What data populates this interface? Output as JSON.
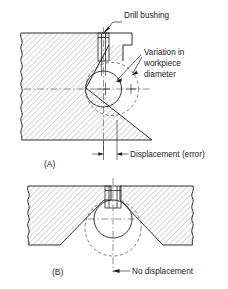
{
  "figure": {
    "title_absent": true,
    "background_color": "#ffffff",
    "line_color": "#1a1a1a",
    "hatch_color": "#9a9a9a",
    "centerline_color": "#555555",
    "panels": [
      {
        "id": "A",
        "caption": "(A)",
        "annotations": [
          {
            "name": "drill-bushing",
            "text": "Drill bushing"
          },
          {
            "name": "variation-line-1",
            "text": "Variation in"
          },
          {
            "name": "variation-line-2",
            "text": "workpiece"
          },
          {
            "name": "variation-line-3",
            "text": "diameter"
          },
          {
            "name": "displacement",
            "text": "Displacement (error)"
          }
        ]
      },
      {
        "id": "B",
        "caption": "(B)",
        "annotations": [
          {
            "name": "no-displacement",
            "text": "No displacement"
          }
        ]
      }
    ]
  },
  "labels": {
    "drill_bushing": "Drill bushing",
    "variation_1": "Variation in",
    "variation_2": "workpiece",
    "variation_3": "diameter",
    "displacement": "Displacement (error)",
    "no_displacement": "No displacement",
    "caption_a": "(A)",
    "caption_b": "(B)"
  }
}
